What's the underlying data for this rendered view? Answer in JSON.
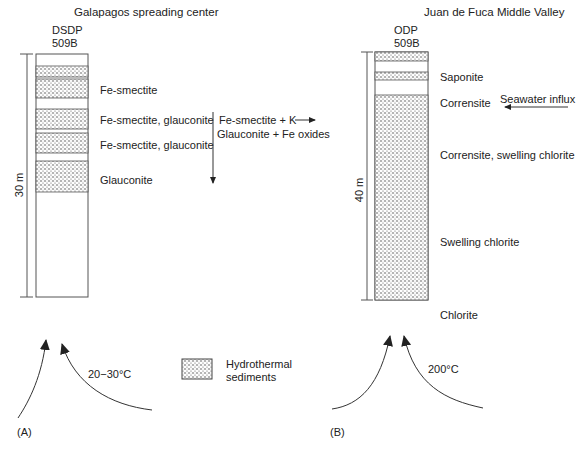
{
  "panel_a": {
    "title": "Galapagos spreading center",
    "site_line1": "DSDP",
    "site_line2": "509B",
    "depth_label": "30 m",
    "layer_labels": [
      "Fe-smectite",
      "Fe-smectite, glauconite",
      "Fe-smectite, glauconite",
      "Glauconite"
    ],
    "reaction_line1": "Fe-smectite + K",
    "reaction_line2": "Glauconite + Fe oxides",
    "temperature": "20−30°C",
    "panel_label": "(A)"
  },
  "panel_b": {
    "title": "Juan de Fuca Middle Valley",
    "site_line1": "ODP",
    "site_line2": "509B",
    "depth_label": "40 m",
    "layer_labels": [
      "Saponite",
      "Corrensite",
      "Corrensite, swelling chlorite",
      "Swelling chlorite",
      "Chlorite"
    ],
    "influx_label": "Seawater influx",
    "temperature": "200°C",
    "panel_label": "(B)"
  },
  "legend": {
    "line1": "Hydrothermal",
    "line2": "sediments"
  },
  "colors": {
    "ink": "#222222",
    "fill": "#ffffff"
  }
}
